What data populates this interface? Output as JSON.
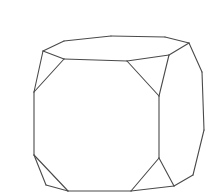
{
  "figure": {
    "stroke_color": "#4a4a4a",
    "background": "#ffffff",
    "vertices": {
      "A": [
        43,
        51
      ],
      "B": [
        64,
        41
      ],
      "C": [
        111,
        36
      ],
      "D": [
        165,
        37
      ],
      "E": [
        189,
        43
      ],
      "F": [
        64,
        59
      ],
      "G": [
        127,
        61
      ],
      "H": [
        169,
        55
      ],
      "I": [
        34,
        92
      ],
      "J": [
        34,
        155
      ],
      "K": [
        159,
        96
      ],
      "L": [
        159,
        158
      ],
      "M": [
        202,
        72
      ],
      "N": [
        204,
        130
      ],
      "O": [
        193,
        175
      ],
      "P": [
        174,
        186
      ],
      "Q": [
        46,
        185
      ],
      "R": [
        68,
        191
      ],
      "S": [
        131,
        191
      ]
    },
    "edges": [
      [
        "A",
        "B"
      ],
      [
        "B",
        "C"
      ],
      [
        "C",
        "D"
      ],
      [
        "D",
        "E"
      ],
      [
        "A",
        "F"
      ],
      [
        "F",
        "G"
      ],
      [
        "G",
        "H"
      ],
      [
        "H",
        "E"
      ],
      [
        "A",
        "I"
      ],
      [
        "F",
        "I"
      ],
      [
        "G",
        "K"
      ],
      [
        "H",
        "K"
      ],
      [
        "E",
        "M"
      ],
      [
        "M",
        "N"
      ],
      [
        "N",
        "O"
      ],
      [
        "O",
        "P"
      ],
      [
        "I",
        "J"
      ],
      [
        "K",
        "L"
      ],
      [
        "J",
        "Q"
      ],
      [
        "Q",
        "R"
      ],
      [
        "J",
        "R"
      ],
      [
        "R",
        "S"
      ],
      [
        "S",
        "L"
      ],
      [
        "L",
        "P"
      ],
      [
        "S",
        "P"
      ]
    ]
  }
}
